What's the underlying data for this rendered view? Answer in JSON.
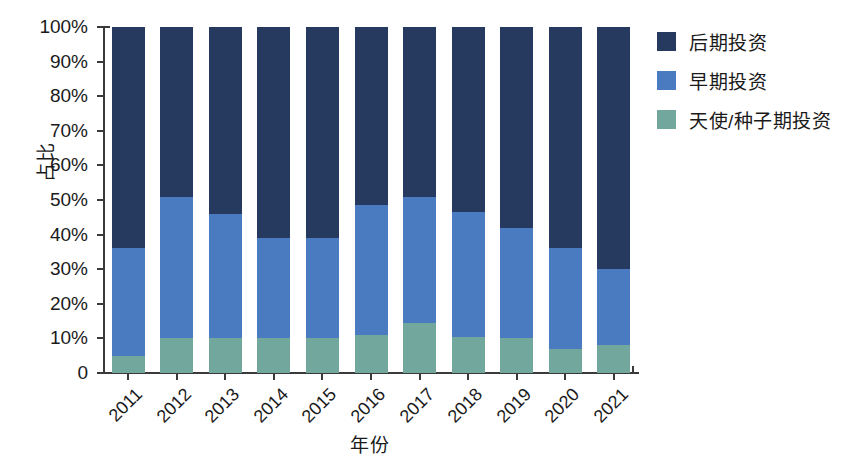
{
  "chart_data": {
    "type": "bar",
    "stacked": true,
    "stack_normalized": true,
    "title": "",
    "xlabel": "年份",
    "ylabel": "占比",
    "categories": [
      "2011",
      "2012",
      "2013",
      "2014",
      "2015",
      "2016",
      "2017",
      "2018",
      "2019",
      "2020",
      "2021"
    ],
    "series": [
      {
        "name": "天使/种子期投资",
        "color": "#72a79e",
        "values": [
          5,
          10,
          10,
          10,
          10,
          11,
          14.5,
          10.5,
          10,
          7,
          8
        ]
      },
      {
        "name": "早期投资",
        "color": "#4a7ac0",
        "values": [
          31,
          41,
          36,
          29,
          29,
          37.5,
          36.5,
          36,
          32,
          29,
          22
        ]
      },
      {
        "name": "后期投资",
        "color": "#253a5e",
        "values": [
          64,
          49,
          54,
          61,
          61,
          51.5,
          49,
          53.5,
          58,
          64,
          70
        ]
      }
    ],
    "ylim": [
      0,
      100
    ],
    "yticks": [
      "0",
      "10%",
      "20%",
      "30%",
      "40%",
      "50%",
      "60%",
      "70%",
      "80%",
      "90%",
      "100%"
    ],
    "ytick_values": [
      0,
      10,
      20,
      30,
      40,
      50,
      60,
      70,
      80,
      90,
      100
    ],
    "grid": false,
    "legend_position": "right",
    "legend_order": [
      "后期投资",
      "早期投资",
      "天使/种子期投资"
    ]
  },
  "legend": {
    "items": [
      {
        "label": "后期投资",
        "color": "#253a5e"
      },
      {
        "label": "早期投资",
        "color": "#4a7ac0"
      },
      {
        "label": "天使/种子期投资",
        "color": "#72a79e"
      }
    ]
  },
  "axes": {
    "y_title": "占比",
    "x_title": "年份"
  }
}
